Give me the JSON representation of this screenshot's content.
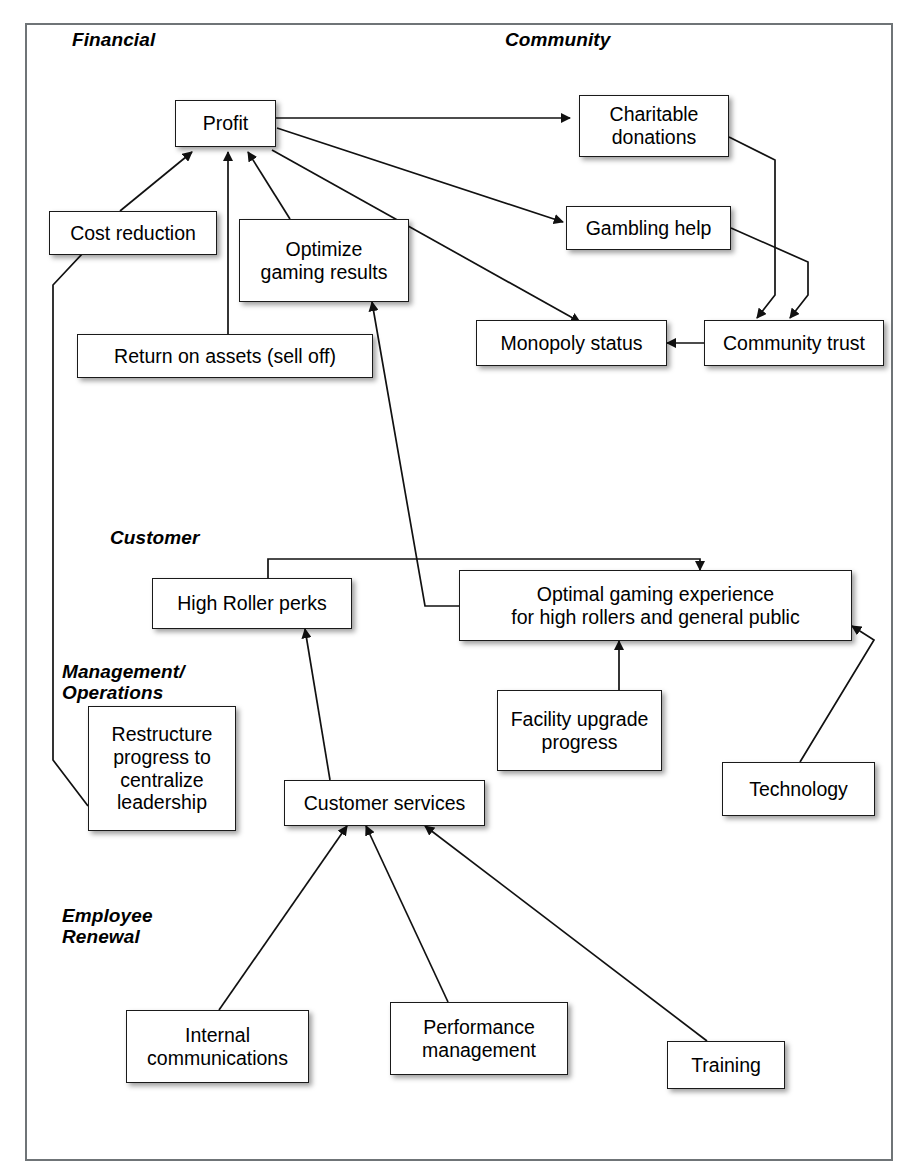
{
  "diagram": {
    "frame": {
      "border_color": "#6f7477"
    },
    "perspectives": [
      {
        "id": "financial",
        "label": "Financial"
      },
      {
        "id": "community",
        "label": "Community"
      },
      {
        "id": "customer",
        "label": "Customer"
      },
      {
        "id": "management",
        "label": "Management/\nOperations"
      },
      {
        "id": "employee",
        "label": "Employee\nRenewal"
      }
    ],
    "nodes": [
      {
        "id": "profit",
        "label": "Profit",
        "perspective": "financial"
      },
      {
        "id": "cost_reduction",
        "label": "Cost reduction",
        "perspective": "financial"
      },
      {
        "id": "optimize_gaming",
        "label": "Optimize\ngaming results",
        "perspective": "financial"
      },
      {
        "id": "return_assets",
        "label": "Return on assets (sell off)",
        "perspective": "financial"
      },
      {
        "id": "charitable",
        "label": "Charitable\ndonations",
        "perspective": "community"
      },
      {
        "id": "gambling_help",
        "label": "Gambling help",
        "perspective": "community"
      },
      {
        "id": "monopoly_status",
        "label": "Monopoly status",
        "perspective": "community"
      },
      {
        "id": "community_trust",
        "label": "Community trust",
        "perspective": "community"
      },
      {
        "id": "high_roller",
        "label": "High Roller perks",
        "perspective": "customer"
      },
      {
        "id": "optimal_gaming",
        "label": "Optimal gaming experience\nfor high rollers and general public",
        "perspective": "customer"
      },
      {
        "id": "facility_upgrade",
        "label": "Facility upgrade\nprogress",
        "perspective": "customer"
      },
      {
        "id": "technology",
        "label": "Technology",
        "perspective": "customer"
      },
      {
        "id": "restructure",
        "label": "Restructure\nprogress to\ncentralize\nleadership",
        "perspective": "management"
      },
      {
        "id": "customer_services",
        "label": "Customer services",
        "perspective": "management"
      },
      {
        "id": "internal_comms",
        "label": "Internal\ncommunications",
        "perspective": "employee"
      },
      {
        "id": "performance_mgmt",
        "label": "Performance\nmanagement",
        "perspective": "employee"
      },
      {
        "id": "training",
        "label": "Training",
        "perspective": "employee"
      }
    ],
    "links": [
      {
        "from": "cost_reduction",
        "to": "profit"
      },
      {
        "from": "return_assets",
        "to": "profit"
      },
      {
        "from": "optimize_gaming",
        "to": "profit"
      },
      {
        "from": "profit",
        "to": "charitable"
      },
      {
        "from": "profit",
        "to": "gambling_help"
      },
      {
        "from": "profit",
        "to": "monopoly_status"
      },
      {
        "from": "charitable",
        "to": "community_trust"
      },
      {
        "from": "gambling_help",
        "to": "community_trust"
      },
      {
        "from": "community_trust",
        "to": "monopoly_status"
      },
      {
        "from": "optimal_gaming",
        "to": "optimize_gaming"
      },
      {
        "from": "restructure",
        "to": "cost_reduction"
      },
      {
        "from": "high_roller",
        "to": "optimal_gaming"
      },
      {
        "from": "facility_upgrade",
        "to": "optimal_gaming"
      },
      {
        "from": "technology",
        "to": "optimal_gaming"
      },
      {
        "from": "customer_services",
        "to": "high_roller"
      },
      {
        "from": "internal_comms",
        "to": "customer_services"
      },
      {
        "from": "performance_mgmt",
        "to": "customer_services"
      },
      {
        "from": "training",
        "to": "customer_services"
      }
    ]
  }
}
